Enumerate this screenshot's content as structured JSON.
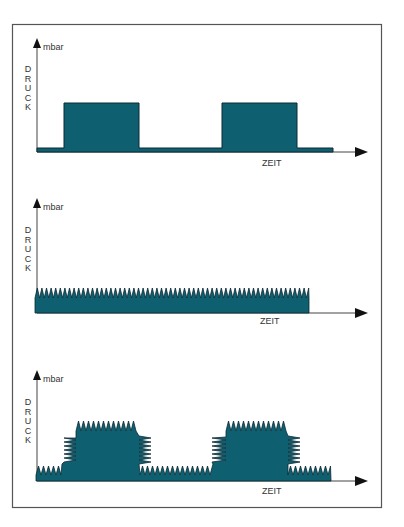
{
  "colors": {
    "fill": "#0e5f70",
    "stroke": "#0b2a33",
    "axis": "#444444",
    "frame": "#555555",
    "text": "#333333"
  },
  "charts": [
    {
      "id": "constant-pulse",
      "y_unit": "mbar",
      "y_label": "DRUCK",
      "x_label": "ZEIT"
    },
    {
      "id": "continuous-ripple",
      "y_unit": "mbar",
      "y_label": "DRUCK",
      "x_label": "ZEIT"
    },
    {
      "id": "pulse-with-ripple",
      "y_unit": "mbar",
      "y_label": "DRUCK",
      "x_label": "ZEIT"
    }
  ],
  "chart_data": [
    {
      "type": "area",
      "title": "",
      "xlabel": "ZEIT",
      "ylabel": "DRUCK (mbar)",
      "grid": false,
      "description": "Rectangular pressure pulses over a low base level",
      "segments": [
        {
          "x_start": 0,
          "x_end": 27,
          "level": "low"
        },
        {
          "x_start": 27,
          "x_end": 102,
          "level": "high"
        },
        {
          "x_start": 102,
          "x_end": 185,
          "level": "low"
        },
        {
          "x_start": 185,
          "x_end": 260,
          "level": "high"
        },
        {
          "x_start": 260,
          "x_end": 296,
          "level": "low"
        }
      ]
    },
    {
      "type": "area",
      "title": "",
      "xlabel": "ZEIT",
      "ylabel": "DRUCK (mbar)",
      "grid": false,
      "description": "Continuous low pressure with constant ripple (sawtooth)",
      "segments": [
        {
          "x_start": 0,
          "x_end": 272,
          "level": "low-ripple"
        }
      ]
    },
    {
      "type": "area",
      "title": "",
      "xlabel": "ZEIT",
      "ylabel": "DRUCK (mbar)",
      "grid": false,
      "description": "Pressure pulses with ripple on both low and high levels",
      "segments": [
        {
          "x_start": 0,
          "x_end": 25,
          "level": "low-ripple"
        },
        {
          "x_start": 25,
          "x_end": 102,
          "level": "high-ripple"
        },
        {
          "x_start": 102,
          "x_end": 175,
          "level": "low-ripple"
        },
        {
          "x_start": 175,
          "x_end": 251,
          "level": "high-ripple"
        },
        {
          "x_start": 251,
          "x_end": 294,
          "level": "low-ripple"
        }
      ]
    }
  ]
}
